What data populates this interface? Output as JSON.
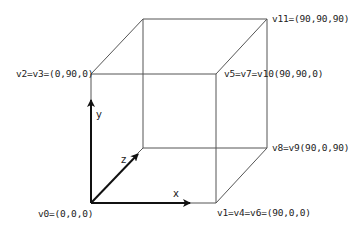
{
  "diagram": {
    "title": "",
    "type": "cube-vertex-coordinates",
    "colors": {
      "edge": "#555555",
      "axis": "#111111",
      "text": "#222222",
      "background": "#ffffff"
    },
    "vertices": {
      "v0": "v0=(0,0,0)",
      "v1": "v1=v4=v6=(90,0,0)",
      "v2": "v2=v3=(0,90,0)",
      "v5": "v5=v7=v10(90,90,0)",
      "v8": "v8=v9(90,0,90)",
      "v11": "v11=(90,90,90)"
    },
    "axes": {
      "x": "x",
      "y": "y",
      "z": "z"
    }
  }
}
